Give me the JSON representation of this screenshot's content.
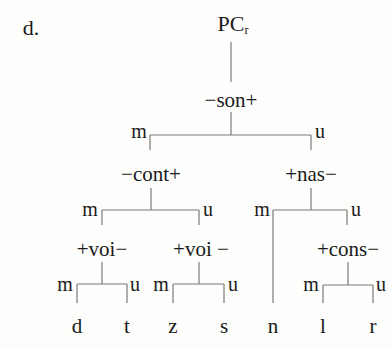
{
  "example_label": "d.",
  "root": {
    "main": "PC",
    "subscript": "r"
  },
  "nodes": {
    "son": "−son+",
    "cont": "−cont+",
    "nas": "+nas−",
    "voi_left": "+voi−",
    "voi_right": "+voi −",
    "cons": "+cons−"
  },
  "branch_labels": {
    "marked": "m",
    "unmarked": "u"
  },
  "leaves": [
    "d",
    "t",
    "z",
    "s",
    "n",
    "l",
    "r"
  ],
  "colors": {
    "line": "#7a7a7a",
    "text": "#1a1a1a",
    "background": "#fdfdfb"
  }
}
